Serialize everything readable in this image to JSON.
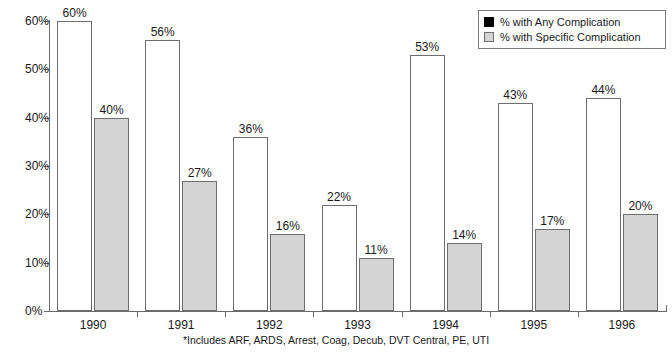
{
  "chart_data": {
    "type": "bar",
    "title": "",
    "xlabel": "",
    "ylabel": "",
    "categories": [
      "1990",
      "1991",
      "1992",
      "1993",
      "1994",
      "1995",
      "1996"
    ],
    "series": [
      {
        "name": "% with Any Complication",
        "key": "any",
        "color": "#ffffff",
        "values": [
          60,
          56,
          36,
          22,
          53,
          43,
          44
        ],
        "value_labels": [
          "60%",
          "56%",
          "36%",
          "22%",
          "53%",
          "43%",
          "44%"
        ]
      },
      {
        "name": "% with Specific Complication",
        "key": "specific",
        "color": "#d4d4d4",
        "values": [
          40,
          27,
          16,
          11,
          14,
          17,
          20
        ],
        "value_labels": [
          "40%",
          "27%",
          "16%",
          "11%",
          "14%",
          "17%",
          "20%"
        ]
      }
    ],
    "ylim": [
      0,
      60
    ],
    "yticks": [
      0,
      10,
      20,
      30,
      40,
      50,
      60
    ],
    "ytick_labels": [
      "0%",
      "10%",
      "20%",
      "30%",
      "40%",
      "50%",
      "60%"
    ],
    "grid": false,
    "legend_position": "top-right"
  },
  "legend": {
    "items": [
      {
        "label": "% with Any Complication",
        "swatch": "black-square-icon"
      },
      {
        "label": "% with Specific Complication",
        "swatch": "gray-square-icon"
      }
    ]
  },
  "footnote": {
    "text": "*Includes ARF, ARDS, Arrest, Coag, Decub, DVT Central, PE, UTI"
  },
  "colors": {
    "any_fill": "#ffffff",
    "specific_fill": "#d4d4d4",
    "outline": "#6e6e6e",
    "axis": "#6b6b6b",
    "text": "#1a1a1a"
  }
}
